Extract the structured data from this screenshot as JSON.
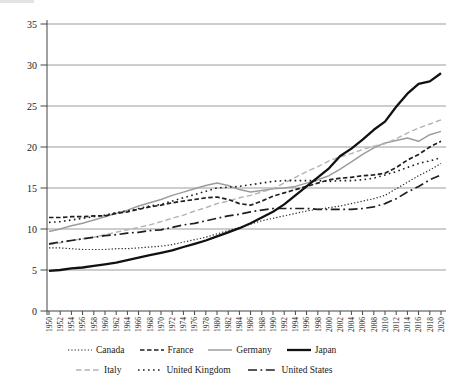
{
  "chart_data": {
    "type": "line",
    "title": "",
    "xlabel": "",
    "ylabel": "",
    "ylim": [
      0,
      35
    ],
    "y_ticks": [
      0,
      5,
      10,
      15,
      20,
      25,
      30,
      35
    ],
    "grid": "horizontal",
    "legend_position": "bottom",
    "legend_rows": [
      [
        "Canada",
        "France",
        "Germany",
        "Japan"
      ],
      [
        "Italy",
        "United Kingdom",
        "United States"
      ]
    ],
    "years": [
      1950,
      1952,
      1954,
      1956,
      1958,
      1960,
      1962,
      1964,
      1966,
      1968,
      1970,
      1972,
      1974,
      1976,
      1978,
      1980,
      1982,
      1984,
      1986,
      1988,
      1990,
      1992,
      1994,
      1996,
      1998,
      2000,
      2002,
      2004,
      2006,
      2008,
      2010,
      2012,
      2014,
      2016,
      2018,
      2020
    ],
    "series": [
      {
        "name": "Canada",
        "color": "#2b2b2b",
        "dash": "1.3 2",
        "width": 1.2,
        "values": [
          7.7,
          7.7,
          7.6,
          7.5,
          7.5,
          7.5,
          7.6,
          7.6,
          7.7,
          7.8,
          7.9,
          8.1,
          8.4,
          8.7,
          9.0,
          9.4,
          9.8,
          10.2,
          10.6,
          11.0,
          11.3,
          11.6,
          11.9,
          12.2,
          12.4,
          12.6,
          12.8,
          13.1,
          13.4,
          13.7,
          14.1,
          14.9,
          15.7,
          16.5,
          17.2,
          18.0
        ]
      },
      {
        "name": "France",
        "color": "#1f1f1f",
        "dash": "4.5 2.5",
        "width": 1.7,
        "values": [
          11.4,
          11.4,
          11.5,
          11.5,
          11.6,
          11.6,
          11.9,
          12.1,
          12.4,
          12.7,
          12.9,
          13.2,
          13.4,
          13.6,
          13.8,
          13.9,
          13.6,
          13.1,
          12.9,
          13.4,
          14.0,
          14.4,
          14.8,
          15.2,
          15.6,
          16.0,
          16.2,
          16.3,
          16.5,
          16.6,
          16.8,
          17.5,
          18.4,
          19.1,
          20.0,
          20.7
        ]
      },
      {
        "name": "Germany",
        "color": "#9c9c9c",
        "dash": "",
        "width": 1.5,
        "values": [
          9.7,
          10.0,
          10.4,
          10.7,
          11.1,
          11.5,
          11.9,
          12.3,
          12.8,
          13.2,
          13.6,
          14.1,
          14.5,
          14.9,
          15.3,
          15.6,
          15.3,
          14.8,
          14.5,
          14.7,
          14.9,
          15.0,
          15.2,
          15.6,
          16.0,
          16.5,
          17.3,
          18.2,
          19.1,
          19.9,
          20.5,
          20.8,
          21.1,
          20.7,
          21.5,
          21.9
        ]
      },
      {
        "name": "Japan",
        "color": "#111111",
        "dash": "",
        "width": 2.3,
        "values": [
          4.9,
          5.0,
          5.2,
          5.3,
          5.5,
          5.7,
          5.9,
          6.2,
          6.5,
          6.8,
          7.1,
          7.4,
          7.8,
          8.2,
          8.6,
          9.1,
          9.6,
          10.1,
          10.7,
          11.4,
          12.1,
          13.0,
          14.1,
          15.2,
          16.3,
          17.4,
          18.9,
          19.8,
          20.9,
          22.1,
          23.1,
          24.9,
          26.5,
          27.7,
          28.0,
          29.0
        ]
      },
      {
        "name": "Italy",
        "color": "#b3b3b3",
        "dash": "5.5 3",
        "width": 1.4,
        "values": [
          8.1,
          8.3,
          8.6,
          8.8,
          9.0,
          9.3,
          9.6,
          9.9,
          10.2,
          10.5,
          10.9,
          11.3,
          11.7,
          12.2,
          12.6,
          13.1,
          13.4,
          13.8,
          14.1,
          14.5,
          14.9,
          15.6,
          16.3,
          17.0,
          17.6,
          18.3,
          18.8,
          19.2,
          19.7,
          20.1,
          20.4,
          21.0,
          21.7,
          22.3,
          22.8,
          23.3
        ]
      },
      {
        "name": "United Kingdom",
        "color": "#1f1f1f",
        "dash": "1.6 3.4",
        "width": 1.6,
        "values": [
          10.8,
          10.9,
          11.1,
          11.3,
          11.5,
          11.7,
          12.0,
          12.2,
          12.5,
          12.8,
          13.0,
          13.4,
          13.8,
          14.2,
          14.6,
          15.0,
          15.1,
          15.2,
          15.4,
          15.6,
          15.8,
          15.9,
          15.9,
          15.9,
          15.9,
          15.8,
          15.9,
          15.9,
          16.0,
          16.2,
          16.6,
          17.0,
          17.5,
          18.0,
          18.3,
          18.7
        ]
      },
      {
        "name": "United States",
        "color": "#1f1f1f",
        "dash": "9 3.5 1.8 3.5",
        "width": 1.7,
        "values": [
          8.2,
          8.4,
          8.6,
          8.8,
          9.0,
          9.2,
          9.3,
          9.5,
          9.6,
          9.8,
          9.9,
          10.2,
          10.5,
          10.7,
          11.0,
          11.3,
          11.6,
          11.8,
          12.1,
          12.3,
          12.5,
          12.5,
          12.5,
          12.5,
          12.4,
          12.4,
          12.4,
          12.4,
          12.5,
          12.7,
          13.1,
          13.7,
          14.5,
          15.2,
          16.0,
          16.6
        ]
      }
    ],
    "axis_color": "#444444",
    "gridline_color": "#9b9b9b"
  }
}
